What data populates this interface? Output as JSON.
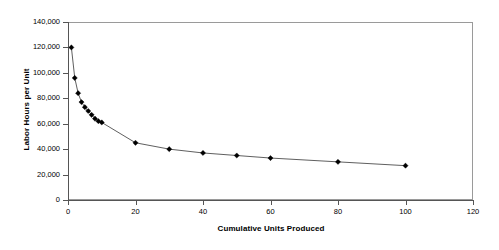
{
  "chart_data": {
    "type": "line",
    "title": "",
    "xlabel": "Cumulative Units Produced",
    "ylabel": "Labor Hours per Unit",
    "xlim": [
      0,
      120
    ],
    "ylim": [
      0,
      140000
    ],
    "xticks": [
      0,
      20,
      40,
      60,
      80,
      100,
      120
    ],
    "xtick_labels": [
      "0",
      "20",
      "40",
      "60",
      "80",
      "100",
      "120"
    ],
    "yticks": [
      0,
      20000,
      40000,
      60000,
      80000,
      100000,
      120000,
      140000
    ],
    "ytick_labels": [
      "0",
      "20,000",
      "40,000",
      "60,000",
      "80,000",
      "100,000",
      "120,000",
      "140,000"
    ],
    "grid": false,
    "legend": "none",
    "marker": "diamond",
    "line_color": "#4d4d4d",
    "marker_color": "#000000",
    "series": [
      {
        "name": "Labor Hours per Unit",
        "x": [
          1,
          2,
          3,
          4,
          5,
          6,
          7,
          8,
          9,
          10,
          20,
          30,
          40,
          50,
          60,
          80,
          100
        ],
        "values": [
          120000,
          96000,
          84000,
          77000,
          73000,
          70000,
          67000,
          64000,
          62000,
          61000,
          45000,
          40000,
          37000,
          35000,
          33000,
          30000,
          27000
        ]
      }
    ]
  }
}
